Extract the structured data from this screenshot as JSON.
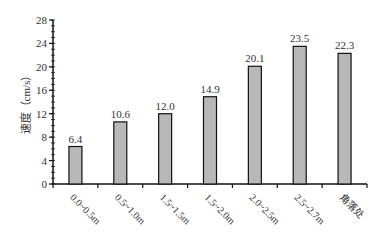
{
  "chart_data": {
    "type": "bar",
    "title": "",
    "xlabel": "",
    "ylabel": "速度（cm/s）",
    "ylim": [
      0,
      28
    ],
    "yticks": [
      0,
      4,
      8,
      12,
      16,
      20,
      24,
      28
    ],
    "grid": false,
    "legend": null,
    "categories": [
      "0.0~0.5m",
      "0.5~1.0m",
      "1.5~1.5m",
      "1.5~2.0m",
      "2.0~2.5m",
      "2.5~2.7m",
      "角落处"
    ],
    "values": [
      6.4,
      10.6,
      12.0,
      14.9,
      20.1,
      23.5,
      22.3
    ],
    "value_labels": [
      "6.4",
      "10.6",
      "12.0",
      "14.9",
      "20.1",
      "23.5",
      "22.3"
    ],
    "colors": {
      "bar_fill": "#b8b8b8",
      "bar_stroke": "#111111",
      "axis": "#111111"
    }
  }
}
